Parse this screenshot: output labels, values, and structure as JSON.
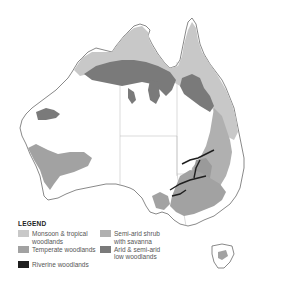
{
  "map": {
    "title": "Australian woodland types",
    "region": "Australia",
    "colors": {
      "land": "#ffffff",
      "coast": "#6b6b6b",
      "borders": "#b5b5b5",
      "monsoon_tropical": "#c8c8c8",
      "temperate": "#a2a2a2",
      "riverine": "#1f1f1f",
      "semi_arid_shrub": "#b0b0b0",
      "arid_semi_arid": "#7a7a7a"
    }
  },
  "legend": {
    "title": "LEGEND",
    "items": [
      {
        "label": "Monsoon & tropical\nwoodlands",
        "color": "#c8c8c8",
        "key": "monsoon_tropical"
      },
      {
        "label": "Semi-arid shrub\nwith savanna",
        "color": "#b0b0b0",
        "key": "semi_arid_shrub"
      },
      {
        "label": "Temperate woodlands",
        "color": "#a2a2a2",
        "key": "temperate"
      },
      {
        "label": "Arid & semi-arid\nlow woodlands",
        "color": "#7a7a7a",
        "key": "arid_semi_arid"
      },
      {
        "label": "Riverine woodlands",
        "color": "#1f1f1f",
        "key": "riverine"
      }
    ]
  }
}
